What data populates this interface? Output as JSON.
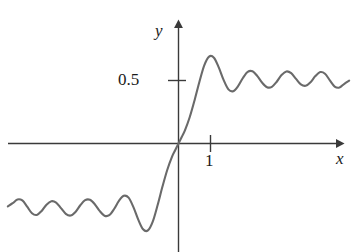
{
  "figure": {
    "title": "",
    "background_color": "#ffffff",
    "curve_color": "#6a6a6a",
    "axis_color": "#3a3a3a",
    "text_color": "#1a1a1a"
  },
  "axes": {
    "x_axis_label": "x",
    "y_axis_label": "y",
    "x_tick_labels": [
      "1"
    ],
    "y_tick_labels": [
      "0.5"
    ]
  },
  "chart_data": {
    "type": "line",
    "title": "",
    "xlabel": "x",
    "ylabel": "y",
    "xlim": [
      -5.3,
      5.6
    ],
    "ylim": [
      -0.86,
      0.86
    ],
    "grid": false,
    "legend": null,
    "annotations": [],
    "x_ticks": [
      1
    ],
    "x_tick_labels": [
      "1"
    ],
    "y_ticks": [
      0.5
    ],
    "y_tick_labels": [
      "0.5"
    ],
    "series": [
      {
        "name": "S(x)",
        "color": "#6a6a6a",
        "x": [
          -5.3,
          -5.15,
          -5.0,
          -4.85,
          -4.7,
          -4.55,
          -4.4,
          -4.25,
          -4.1,
          -3.95,
          -3.8,
          -3.65,
          -3.5,
          -3.35,
          -3.2,
          -3.05,
          -2.9,
          -2.75,
          -2.6,
          -2.45,
          -2.3,
          -2.15,
          -2.0,
          -1.85,
          -1.7,
          -1.55,
          -1.4,
          -1.25,
          -1.1,
          -0.95,
          -0.8,
          -0.65,
          -0.5,
          -0.35,
          -0.2,
          -0.1,
          0.0,
          0.1,
          0.2,
          0.35,
          0.5,
          0.65,
          0.8,
          0.95,
          1.1,
          1.25,
          1.4,
          1.55,
          1.7,
          1.85,
          2.0,
          2.15,
          2.3,
          2.45,
          2.6,
          2.75,
          2.9,
          3.05,
          3.2,
          3.35,
          3.5,
          3.65,
          3.8,
          3.95,
          4.1,
          4.25,
          4.4,
          4.55,
          4.7,
          4.85,
          5.0,
          5.15,
          5.3
        ],
        "y": [
          -0.499,
          -0.474,
          -0.444,
          -0.452,
          -0.501,
          -0.554,
          -0.567,
          -0.535,
          -0.486,
          -0.458,
          -0.469,
          -0.513,
          -0.558,
          -0.572,
          -0.543,
          -0.49,
          -0.45,
          -0.447,
          -0.482,
          -0.535,
          -0.573,
          -0.569,
          -0.52,
          -0.455,
          -0.415,
          -0.43,
          -0.505,
          -0.604,
          -0.681,
          -0.69,
          -0.62,
          -0.49,
          -0.344,
          -0.21,
          -0.104,
          -0.052,
          0.0,
          0.052,
          0.104,
          0.21,
          0.344,
          0.49,
          0.62,
          0.69,
          0.681,
          0.604,
          0.505,
          0.43,
          0.415,
          0.455,
          0.52,
          0.569,
          0.573,
          0.535,
          0.482,
          0.447,
          0.45,
          0.49,
          0.543,
          0.572,
          0.558,
          0.513,
          0.469,
          0.458,
          0.486,
          0.535,
          0.567,
          0.554,
          0.501,
          0.452,
          0.444,
          0.474,
          0.499
        ]
      }
    ]
  }
}
